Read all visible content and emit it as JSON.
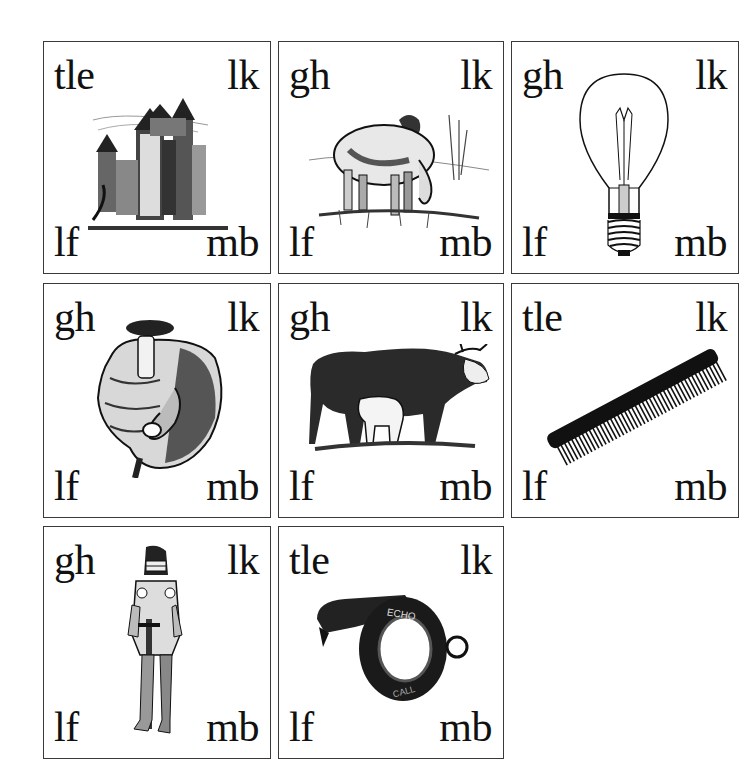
{
  "cards": [
    {
      "picture": "castle",
      "top_left": "tle",
      "top_right": "lk",
      "bottom_left": "lf",
      "bottom_right": "mb"
    },
    {
      "picture": "sheep",
      "top_left": "gh",
      "top_right": "lk",
      "bottom_left": "lf",
      "bottom_right": "mb"
    },
    {
      "picture": "light-bulb",
      "top_left": "gh",
      "top_right": "lk",
      "bottom_left": "lf",
      "bottom_right": "mb"
    },
    {
      "picture": "thumb-fist",
      "top_left": "gh",
      "top_right": "lk",
      "bottom_left": "lf",
      "bottom_right": "mb"
    },
    {
      "picture": "cow-and-calf",
      "top_left": "gh",
      "top_right": "lk",
      "bottom_left": "lf",
      "bottom_right": "mb"
    },
    {
      "picture": "comb",
      "top_left": "tle",
      "top_right": "lk",
      "bottom_left": "lf",
      "bottom_right": "mb"
    },
    {
      "picture": "knight",
      "top_left": "gh",
      "top_right": "lk",
      "bottom_left": "lf",
      "bottom_right": "mb"
    },
    {
      "picture": "whistle",
      "top_left": "tle",
      "top_right": "lk",
      "bottom_left": "lf",
      "bottom_right": "mb",
      "whistle_text": [
        "ECHO",
        "CALL"
      ]
    }
  ]
}
